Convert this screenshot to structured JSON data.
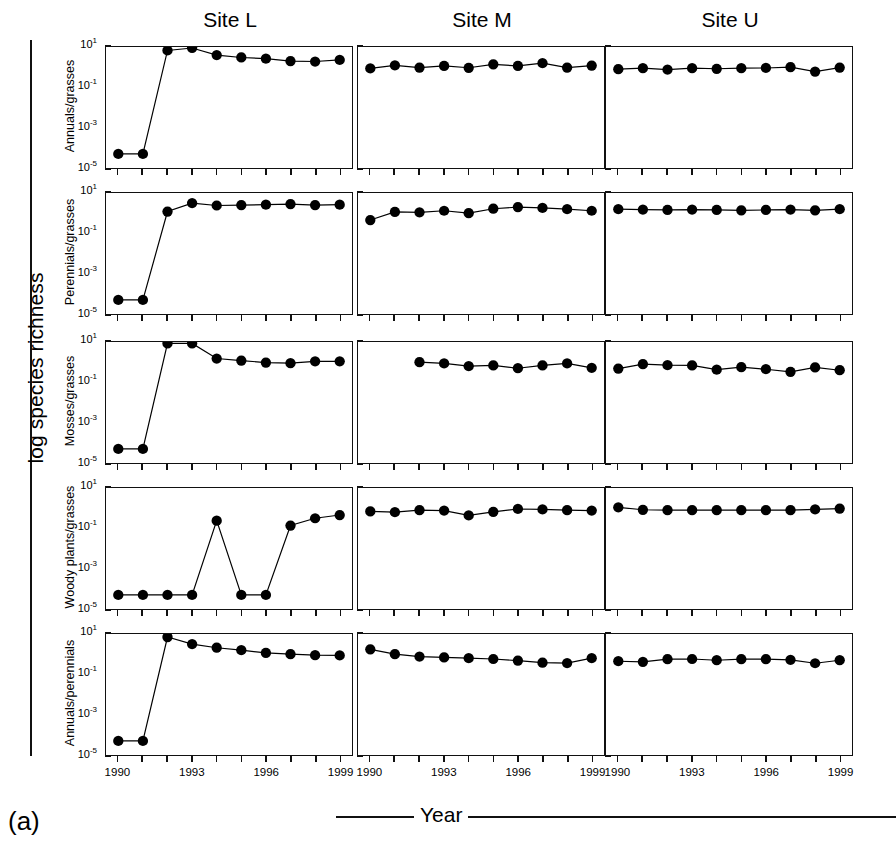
{
  "figure": {
    "panel_letter": "(a)",
    "global_ylabel": "log species richness",
    "xlabel": "Year"
  },
  "columns": [
    {
      "title": "Site L"
    },
    {
      "title": "Site M"
    },
    {
      "title": "Site U"
    }
  ],
  "rows": [
    {
      "label": "Annuals/grasses"
    },
    {
      "label": "Perennials/grasses"
    },
    {
      "label": "Mosses/grasses"
    },
    {
      "label": "Woody plants/grasses"
    },
    {
      "label": "Annuals/perennials"
    }
  ],
  "axes": {
    "ytick_labels": [
      "10¹",
      "10⁻¹",
      "10⁻³",
      "10⁻⁵"
    ],
    "ytick_exponents": [
      "1",
      "-1",
      "-3",
      "-5"
    ],
    "ytick_log_values": [
      1,
      -1,
      -3,
      -5
    ],
    "ylim_log": [
      -5,
      1
    ],
    "xtick_labels": [
      "1990",
      "1993",
      "1996",
      "1999"
    ],
    "xtick_values": [
      1990,
      1993,
      1996,
      1999
    ],
    "xlim": [
      1989.5,
      1999.5
    ],
    "x_minor_ticks": [
      1990,
      1991,
      1992,
      1993,
      1994,
      1995,
      1996,
      1997,
      1998,
      1999
    ],
    "grid": false,
    "legend": "none"
  },
  "chart_data": {
    "type": "line",
    "title": "",
    "subtitle": "",
    "xlabel": "Year",
    "ylabel": "log species richness",
    "xlim": [
      1989.5,
      1999.5
    ],
    "ylim_log": [
      -5,
      1
    ],
    "yscale": "log",
    "marker": "filled-circle",
    "marker_color": "#000000",
    "line_color": "#000000",
    "note": "Values are log10 of the species-richness ratio; y axis ticks at 10^1, 10^-1, 10^-3, 10^-5. Points at log10 = -4.3 represent the plotted floor (ratio effectively zero/absent).",
    "x": [
      1990,
      1991,
      1992,
      1993,
      1994,
      1995,
      1996,
      1997,
      1998,
      1999
    ],
    "panels": [
      {
        "row": "Annuals/grasses",
        "column": "Site L",
        "x": [
          1990,
          1991,
          1992,
          1993,
          1994,
          1995,
          1996,
          1997,
          1998,
          1999
        ],
        "values_log10": [
          -4.3,
          -4.3,
          0.83,
          0.95,
          0.6,
          0.48,
          0.42,
          0.3,
          0.28,
          0.36
        ]
      },
      {
        "row": "Annuals/grasses",
        "column": "Site M",
        "x": [
          1990,
          1991,
          1992,
          1993,
          1994,
          1995,
          1996,
          1997,
          1998,
          1999
        ],
        "values_log10": [
          -0.06,
          0.09,
          -0.02,
          0.06,
          -0.03,
          0.14,
          0.06,
          0.2,
          -0.02,
          0.08
        ]
      },
      {
        "row": "Annuals/grasses",
        "column": "Site U",
        "x": [
          1990,
          1991,
          1992,
          1993,
          1994,
          1995,
          1996,
          1997,
          1998,
          1999
        ],
        "values_log10": [
          -0.1,
          -0.05,
          -0.12,
          -0.05,
          -0.08,
          -0.05,
          -0.04,
          0.0,
          -0.22,
          -0.02
        ]
      },
      {
        "row": "Perennials/grasses",
        "column": "Site L",
        "x": [
          1990,
          1991,
          1992,
          1993,
          1994,
          1995,
          1996,
          1997,
          1998,
          1999
        ],
        "values_log10": [
          -4.3,
          -4.3,
          0.08,
          0.5,
          0.38,
          0.4,
          0.42,
          0.45,
          0.4,
          0.42
        ]
      },
      {
        "row": "Perennials/grasses",
        "column": "Site M",
        "x": [
          1990,
          1991,
          1992,
          1993,
          1994,
          1995,
          1996,
          1997,
          1998,
          1999
        ],
        "values_log10": [
          -0.34,
          0.06,
          0.04,
          0.12,
          0.0,
          0.22,
          0.3,
          0.26,
          0.2,
          0.12
        ]
      },
      {
        "row": "Perennials/grasses",
        "column": "Site U",
        "x": [
          1990,
          1991,
          1992,
          1993,
          1994,
          1995,
          1996,
          1997,
          1998,
          1999
        ],
        "values_log10": [
          0.2,
          0.18,
          0.16,
          0.18,
          0.16,
          0.14,
          0.16,
          0.18,
          0.14,
          0.2
        ]
      },
      {
        "row": "Mosses/grasses",
        "column": "Site L",
        "x": [
          1990,
          1991,
          1992,
          1993,
          1994,
          1995,
          1996,
          1997,
          1998,
          1999
        ],
        "values_log10": [
          -4.3,
          -4.3,
          0.93,
          0.93,
          0.18,
          0.08,
          -0.02,
          -0.05,
          0.04,
          0.04
        ]
      },
      {
        "row": "Mosses/grasses",
        "column": "Site M",
        "x": [
          1992,
          1993,
          1994,
          1995,
          1996,
          1997,
          1998,
          1999
        ],
        "values_log10": [
          0.0,
          -0.06,
          -0.2,
          -0.16,
          -0.3,
          -0.16,
          -0.06,
          -0.28
        ]
      },
      {
        "row": "Mosses/grasses",
        "column": "Site U",
        "x": [
          1990,
          1991,
          1992,
          1993,
          1994,
          1995,
          1996,
          1997,
          1998,
          1999
        ],
        "values_log10": [
          -0.32,
          -0.1,
          -0.15,
          -0.16,
          -0.37,
          -0.25,
          -0.35,
          -0.48,
          -0.26,
          -0.4
        ]
      },
      {
        "row": "Woody plants/grasses",
        "column": "Site L",
        "x": [
          1990,
          1991,
          1992,
          1993,
          1994,
          1995,
          1996,
          1997,
          1998,
          1999
        ],
        "values_log10": [
          -4.3,
          -4.3,
          -4.3,
          -4.3,
          -0.62,
          -4.3,
          -4.3,
          -0.86,
          -0.5,
          -0.34
        ]
      },
      {
        "row": "Woody plants/grasses",
        "column": "Site M",
        "x": [
          1990,
          1991,
          1992,
          1993,
          1994,
          1995,
          1996,
          1997,
          1998,
          1999
        ],
        "values_log10": [
          -0.16,
          -0.2,
          -0.1,
          -0.12,
          -0.36,
          -0.18,
          -0.04,
          -0.06,
          -0.1,
          -0.12
        ]
      },
      {
        "row": "Woody plants/grasses",
        "column": "Site U",
        "x": [
          1990,
          1991,
          1992,
          1993,
          1994,
          1995,
          1996,
          1997,
          1998,
          1999
        ],
        "values_log10": [
          0.04,
          -0.08,
          -0.1,
          -0.1,
          -0.1,
          -0.1,
          -0.1,
          -0.1,
          -0.06,
          -0.02
        ]
      },
      {
        "row": "Annuals/perennials",
        "column": "Site L",
        "x": [
          1990,
          1991,
          1992,
          1993,
          1994,
          1995,
          1996,
          1997,
          1998,
          1999
        ],
        "values_log10": [
          -4.3,
          -4.3,
          0.85,
          0.5,
          0.32,
          0.2,
          0.06,
          0.0,
          -0.05,
          -0.06
        ]
      },
      {
        "row": "Annuals/perennials",
        "column": "Site M",
        "x": [
          1990,
          1991,
          1992,
          1993,
          1994,
          1995,
          1996,
          1997,
          1998,
          1999
        ],
        "values_log10": [
          0.24,
          0.0,
          -0.12,
          -0.16,
          -0.2,
          -0.24,
          -0.32,
          -0.42,
          -0.44,
          -0.2
        ]
      },
      {
        "row": "Annuals/perennials",
        "column": "Site U",
        "x": [
          1990,
          1991,
          1992,
          1993,
          1994,
          1995,
          1996,
          1997,
          1998,
          1999
        ],
        "values_log10": [
          -0.35,
          -0.38,
          -0.25,
          -0.24,
          -0.3,
          -0.25,
          -0.25,
          -0.28,
          -0.45,
          -0.3
        ]
      }
    ]
  }
}
